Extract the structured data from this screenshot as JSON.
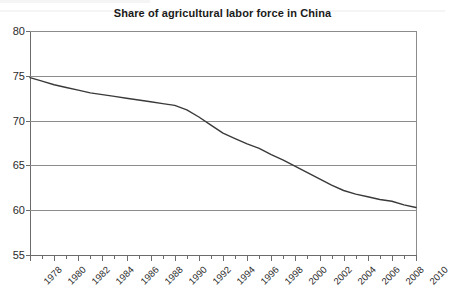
{
  "chart_data": {
    "type": "line",
    "title": "Share of agricultural labor force in China",
    "xlabel": "",
    "ylabel": "",
    "ylim": [
      55,
      80
    ],
    "xlim": [
      1978,
      2010
    ],
    "yticks": [
      80,
      75,
      70,
      65,
      60,
      55
    ],
    "xticks": [
      1978,
      1979,
      1980,
      1981,
      1982,
      1983,
      1984,
      1985,
      1986,
      1987,
      1988,
      1989,
      1990,
      1991,
      1992,
      1993,
      1994,
      1995,
      1996,
      1997,
      1998,
      1999,
      2000,
      2001,
      2002,
      2003,
      2004,
      2005,
      2006,
      2007,
      2008,
      2009,
      2010
    ],
    "xtick_labels": [
      "1978",
      "1980",
      "1982",
      "1984",
      "1986",
      "1988",
      "1990",
      "1992",
      "1994",
      "1996",
      "1998",
      "2000",
      "2002",
      "2004",
      "2006",
      "2008",
      "2010"
    ],
    "xtick_label_years": [
      1978,
      1980,
      1982,
      1984,
      1986,
      1988,
      1990,
      1992,
      1994,
      1996,
      1998,
      2000,
      2002,
      2004,
      2006,
      2008,
      2010
    ],
    "grid": true,
    "legend": "none",
    "line_color": "#3a3a3a",
    "grid_color": "#8c8c8c",
    "axis_color": "#6b6b6b",
    "x": [
      1978,
      1979,
      1980,
      1981,
      1982,
      1983,
      1984,
      1985,
      1986,
      1987,
      1988,
      1989,
      1990,
      1991,
      1992,
      1993,
      1994,
      1995,
      1996,
      1997,
      1998,
      1999,
      2000,
      2001,
      2002,
      2003,
      2004,
      2005,
      2006,
      2007,
      2008,
      2009,
      2010
    ],
    "values": [
      74.8,
      74.4,
      74.0,
      73.7,
      73.4,
      73.1,
      72.9,
      72.7,
      72.5,
      72.3,
      72.1,
      71.9,
      71.7,
      71.2,
      70.4,
      69.5,
      68.6,
      68.0,
      67.4,
      66.9,
      66.2,
      65.6,
      64.9,
      64.2,
      63.5,
      62.8,
      62.2,
      61.8,
      61.5,
      61.2,
      61.0,
      60.6,
      60.3
    ],
    "series_name": "Share of agricultural labor force"
  }
}
